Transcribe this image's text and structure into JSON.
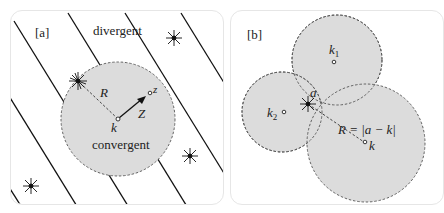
{
  "panel_a": {
    "label": "[a]",
    "region_outer": "divergent",
    "region_inner": "convergent",
    "radius_label": "R",
    "center_label": "k",
    "point_label": "z",
    "vector_label": "Z",
    "colors": {
      "disk_fill": "#dcdcdc",
      "line": "#111111",
      "dash": "#555555"
    }
  },
  "panel_b": {
    "label": "[b]",
    "center_labels": [
      "k1",
      "k2",
      "k"
    ],
    "k1_base": "k",
    "k1_sub": "1",
    "k2_base": "k",
    "k2_sub": "2",
    "k_label": "k",
    "singularity_label": "a",
    "radius_formula": "R = |a − k|",
    "colors": {
      "disk_fill": "#dcdcdc",
      "dash": "#555555"
    }
  }
}
